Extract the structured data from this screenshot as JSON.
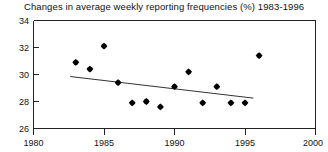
{
  "chart_data": {
    "type": "scatter",
    "title": "Changes in average weekly reporting frequencies (%) 1983-1996",
    "xlabel": "",
    "ylabel": "",
    "xlim": [
      1980,
      2000
    ],
    "ylim": [
      26,
      34
    ],
    "xticks": [
      1980,
      1985,
      1990,
      1995,
      2000
    ],
    "yticks": [
      26,
      28,
      30,
      32,
      34
    ],
    "grid": false,
    "legend": null,
    "x": [
      1983,
      1984,
      1985,
      1986,
      1987,
      1988,
      1989,
      1990,
      1991,
      1992,
      1993,
      1994,
      1995,
      1996
    ],
    "values": [
      30.9,
      30.4,
      32.1,
      29.4,
      27.9,
      28.0,
      27.6,
      29.1,
      30.2,
      27.9,
      29.1,
      27.9,
      27.9,
      31.4
    ],
    "series": [
      {
        "name": "Average weekly reporting frequency",
        "marker": "filled-diamond",
        "color": "#000000",
        "values": [
          30.9,
          30.4,
          32.1,
          29.4,
          27.9,
          28.0,
          27.6,
          29.1,
          30.2,
          27.9,
          29.1,
          27.9,
          27.9,
          31.4
        ]
      }
    ],
    "trend_line": {
      "type": "linear-fit",
      "color": "#333333",
      "x_start": 1982.6,
      "y_start": 29.85,
      "x_end": 1995.6,
      "y_end": 28.25
    }
  },
  "axis": {
    "y_tick_labels": [
      "34",
      "32",
      "30",
      "28",
      "26"
    ],
    "x_tick_labels": [
      "1980",
      "1985",
      "1990",
      "1995",
      "2000"
    ]
  }
}
